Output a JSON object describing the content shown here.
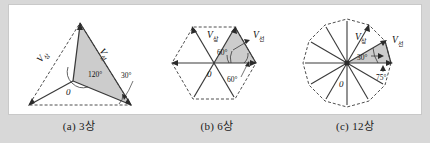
{
  "figure": {
    "background_color": "#d8d8d8",
    "panel_color": "#ffffff",
    "line_color": "#3a3a3a",
    "fill_color": "#cccccc"
  },
  "diagrams": [
    {
      "id": "three-phase",
      "caption": "(a) 3상",
      "phase_label": "V",
      "phase_sub": "상",
      "line_label": "V",
      "line_sub": "선",
      "origin_label": "0",
      "angles": [
        "120°",
        "30°"
      ],
      "sides": 3
    },
    {
      "id": "six-phase",
      "caption": "(b) 6상",
      "phase_label": "V",
      "phase_sub": "상",
      "line_label": "V",
      "line_sub": "선",
      "origin_label": "0",
      "angles": [
        "60°",
        "60°"
      ],
      "sides": 6
    },
    {
      "id": "twelve-phase",
      "caption": "(c) 12상",
      "phase_label": "V",
      "phase_sub": "상",
      "line_label": "V",
      "line_sub": "선",
      "origin_label": "0",
      "angles": [
        "30°",
        "75°"
      ],
      "sides": 12
    }
  ]
}
